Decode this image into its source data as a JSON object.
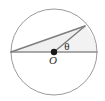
{
  "figure": {
    "name": "circle-with-central-angle",
    "canvas": {
      "width": 105,
      "height": 101,
      "background": "#ffffff"
    },
    "labels": {
      "theta": "θ",
      "center": "O"
    },
    "colors": {
      "circle_stroke": "#9a9a9a",
      "diameter_stroke": "#8d8d8d",
      "chord_stroke": "#7d7d7d",
      "radius_stroke": "#7d7d7d",
      "triangle_fill": "#f0f0f0",
      "center_dot": "#1a1a1a",
      "label_color": "#2b2b2b"
    }
  },
  "chart_data": {
    "type": "diagram",
    "title": "",
    "subtitle": "",
    "xlabel": "",
    "ylabel": "",
    "circle": {
      "center": {
        "x": 54,
        "y": 52
      },
      "radius": 43,
      "stroke": "#9a9a9a",
      "stroke_width": 1
    },
    "points": [
      {
        "name": "A",
        "role": "left-diameter-endpoint",
        "x": 11,
        "y": 52,
        "label": ""
      },
      {
        "name": "O",
        "role": "center",
        "x": 54,
        "y": 52,
        "label": "O"
      },
      {
        "name": "B",
        "role": "right-diameter-endpoint",
        "x": 97,
        "y": 52,
        "label": ""
      },
      {
        "name": "P",
        "role": "upper-right-arc-point",
        "x": 85,
        "y": 26,
        "label": ""
      }
    ],
    "segments": [
      {
        "name": "diameter-AB",
        "from": "A",
        "to": "B",
        "stroke": "#8d8d8d",
        "stroke_width": 1.6
      },
      {
        "name": "chord-AP",
        "from": "A",
        "to": "P",
        "stroke": "#7d7d7d",
        "stroke_width": 1.4
      },
      {
        "name": "radius-OP",
        "from": "O",
        "to": "P",
        "stroke": "#7d7d7d",
        "stroke_width": 1.4
      }
    ],
    "filled_regions": [
      {
        "name": "triangle-AOP",
        "vertices": [
          "A",
          "O",
          "P"
        ],
        "fill": "#f0f0f0"
      },
      {
        "name": "sector-OPB",
        "vertices": [
          "O",
          "P",
          "B"
        ],
        "fill": "#f2f2f2"
      }
    ],
    "angles": [
      {
        "name": "central-angle",
        "vertex": "O",
        "label": "θ",
        "between": [
          "radius-OP",
          "diameter-OB"
        ],
        "label_position": {
          "x": 67,
          "y": 50
        }
      }
    ],
    "annotations": [
      {
        "name": "center-dot",
        "x": 54,
        "y": 52,
        "radius": 3.2,
        "fill": "#1a1a1a"
      },
      {
        "name": "center-label",
        "text": "O",
        "x": 53,
        "y": 64
      }
    ],
    "grid": false,
    "legend": null
  }
}
